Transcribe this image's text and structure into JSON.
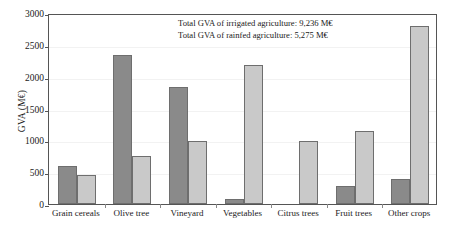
{
  "chart_data": {
    "type": "bar",
    "title": "",
    "xlabel": "",
    "ylabel": "GVA (M€)",
    "ylim": [
      0,
      3000
    ],
    "ytick_step": 500,
    "yticks": [
      0,
      500,
      1000,
      1500,
      2000,
      2500,
      3000
    ],
    "ytick_labels": [
      "0",
      "500",
      "1000",
      "1500",
      "2000",
      "2500",
      "3000"
    ],
    "grid": true,
    "legend": "none",
    "categories": [
      "Grain cereals",
      "Olive tree",
      "Vineyard",
      "Vegetables",
      "Citrus trees",
      "Fruit trees",
      "Other crops"
    ],
    "series": [
      {
        "name": "Irrigated agriculture",
        "color": "#8a8a8a",
        "values": [
          600,
          2340,
          1840,
          80,
          0,
          280,
          400
        ]
      },
      {
        "name": "Rainfed agriculture",
        "color": "#c9c9c9",
        "values": [
          450,
          750,
          990,
          2180,
          990,
          1150,
          2800
        ]
      }
    ],
    "annotations": [
      "Total GVA of irrigated agriculture: 9,236 M€",
      "Total GVA of rainfed agriculture: 5,275 M€"
    ]
  },
  "style": {
    "frame_color": "#555555",
    "grid_color": "#f2f2f2",
    "background": "#ffffff"
  }
}
